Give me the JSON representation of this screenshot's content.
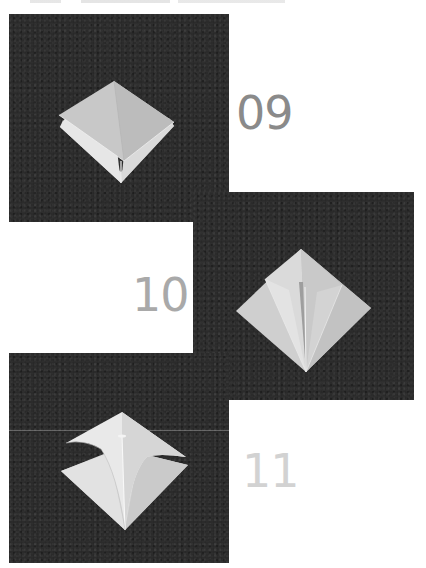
{
  "header": {
    "truncated_caption": ""
  },
  "steps": [
    {
      "number": "09",
      "number_color": "#8a8a8a",
      "description": "Folded square base, diamond orientation with layered flaps"
    },
    {
      "number": "10",
      "number_color": "#a9a9a9",
      "description": "Side edges folded to center crease forming kite shape"
    },
    {
      "number": "11",
      "number_color": "#d2d2d2",
      "description": "Top flap folded down, kite folds unfolded"
    }
  ],
  "colors": {
    "panel_background": "#2b2b2b",
    "paper_light": "#e8e8e8",
    "paper_mid": "#c9c9c9",
    "paper_shadow": "#a8a8a8",
    "page_background": "#ffffff"
  }
}
